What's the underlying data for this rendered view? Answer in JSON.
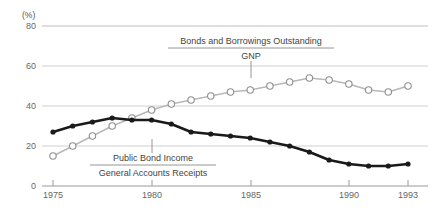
{
  "chart_data": {
    "type": "line",
    "title": "",
    "xlabel": "",
    "ylabel": "",
    "unit": "(%)",
    "ylim": [
      0,
      80
    ],
    "xlim": [
      1975,
      1993
    ],
    "yticks": [
      "0",
      "20",
      "40",
      "60",
      "80"
    ],
    "ytick_values": [
      0,
      20,
      40,
      60,
      80
    ],
    "xticks": [
      "1975",
      "1980",
      "1985",
      "1990",
      "1993"
    ],
    "xtick_values": [
      1975,
      1980,
      1985,
      1990,
      1993
    ],
    "grid": "horizontal",
    "legend_position": "inline-annotation",
    "x": [
      1975,
      1976,
      1977,
      1978,
      1979,
      1980,
      1981,
      1982,
      1983,
      1984,
      1985,
      1986,
      1987,
      1988,
      1989,
      1990,
      1991,
      1992,
      1993
    ],
    "series": [
      {
        "name": "Bonds and Borrowings Outstanding / GNP",
        "marker": "open-circle",
        "color": "#b8b8b8",
        "values": [
          15,
          20,
          25,
          30,
          34,
          38,
          41,
          43,
          45,
          47,
          48,
          50,
          52,
          54,
          53,
          51,
          48,
          47,
          50
        ]
      },
      {
        "name": "Public Bond Income / General Accounts Receipts",
        "marker": "filled-circle",
        "color": "#1a1a1a",
        "values": [
          27,
          30,
          32,
          34,
          33,
          33,
          31,
          27,
          26,
          25,
          24,
          22,
          20,
          17,
          13,
          11,
          10,
          10,
          11
        ]
      }
    ],
    "annotations": [
      {
        "id": "upper",
        "numerator": "Bonds and Borrowings Outstanding",
        "denominator": "GNP",
        "style": "fraction"
      },
      {
        "id": "lower",
        "numerator": "Public Bond Income",
        "denominator": "General Accounts Receipts",
        "style": "fraction"
      }
    ]
  }
}
